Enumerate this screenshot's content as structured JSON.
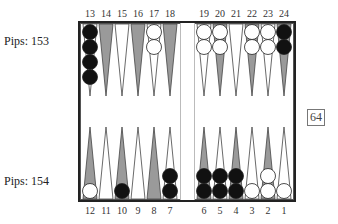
{
  "player_top": {
    "pips_label": "Pips: 153"
  },
  "player_bottom": {
    "pips_label": "Pips: 154"
  },
  "cube": {
    "value": "64"
  },
  "top_point_labels": [
    "13",
    "14",
    "15",
    "16",
    "17",
    "18",
    "19",
    "20",
    "21",
    "22",
    "23",
    "24"
  ],
  "bottom_point_labels": [
    "12",
    "11",
    "10",
    "9",
    "8",
    "7",
    "6",
    "5",
    "4",
    "3",
    "2",
    "1"
  ],
  "colors": {
    "black_checker": "#111111",
    "white_checker": "#ffffff",
    "shaded_point": "#9a9a9a",
    "board_border": "#222222"
  },
  "points": {
    "13": {
      "color": "black",
      "count": 4
    },
    "17": {
      "color": "white",
      "count": 2
    },
    "19": {
      "color": "white",
      "count": 2
    },
    "20": {
      "color": "white",
      "count": 2
    },
    "22": {
      "color": "white",
      "count": 2
    },
    "23": {
      "color": "white",
      "count": 2
    },
    "24": {
      "color": "black",
      "count": 2
    },
    "12": {
      "color": "white",
      "count": 1
    },
    "10": {
      "color": "black",
      "count": 1
    },
    "7": {
      "color": "black",
      "count": 2
    },
    "6": {
      "color": "black",
      "count": 2
    },
    "5": {
      "color": "black",
      "count": 2
    },
    "4": {
      "color": "black",
      "count": 2
    },
    "3": {
      "color": "white",
      "count": 1
    },
    "2": {
      "color": "white",
      "count": 2
    },
    "1": {
      "color": "white",
      "count": 1
    }
  }
}
